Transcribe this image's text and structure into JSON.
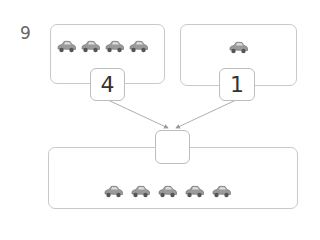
{
  "question_number": "9",
  "left_group": {
    "car_count": 4,
    "value": "4"
  },
  "right_group": {
    "car_count": 1,
    "value": "1"
  },
  "total_group": {
    "car_count": 5,
    "answer": ""
  },
  "icon": "car-icon",
  "colors": {
    "border": "#c9c9c9",
    "car": "#8a8a8a",
    "arrow": "#999999"
  }
}
